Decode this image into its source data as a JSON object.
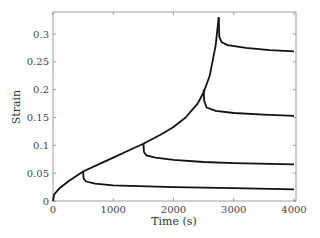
{
  "chart_data": {
    "type": "line",
    "title": "",
    "xlabel": "Time (s)",
    "ylabel": "Strain",
    "xlim": [
      0,
      4000
    ],
    "ylim": [
      0,
      0.34
    ],
    "xticks": [
      "0",
      "1000",
      "2000",
      "3000",
      "4000"
    ],
    "yticks": [
      "0",
      "0.05",
      "0.1",
      "0.15",
      "0.2",
      "0.25",
      "0.3"
    ],
    "grid": false,
    "legend": "none",
    "series": [
      {
        "name": "loading curve",
        "x": [
          0,
          20,
          100,
          250,
          500,
          800,
          1000,
          1300,
          1500,
          1800,
          2000,
          2200,
          2400,
          2500,
          2600,
          2700,
          2750
        ],
        "y": [
          0,
          0.012,
          0.022,
          0.035,
          0.053,
          0.068,
          0.078,
          0.093,
          0.103,
          0.12,
          0.133,
          0.15,
          0.175,
          0.195,
          0.225,
          0.28,
          0.33
        ]
      },
      {
        "name": "unload at 500 s",
        "x": [
          500,
          510,
          550,
          700,
          1000,
          2000,
          3000,
          4000
        ],
        "y": [
          0.053,
          0.04,
          0.035,
          0.031,
          0.028,
          0.025,
          0.023,
          0.021
        ]
      },
      {
        "name": "unload at 1500 s",
        "x": [
          1500,
          1510,
          1550,
          1700,
          2000,
          2500,
          3000,
          4000
        ],
        "y": [
          0.103,
          0.088,
          0.082,
          0.078,
          0.074,
          0.07,
          0.068,
          0.066
        ]
      },
      {
        "name": "unload at 2500 s",
        "x": [
          2500,
          2510,
          2550,
          2700,
          3000,
          3500,
          4000
        ],
        "y": [
          0.2,
          0.18,
          0.168,
          0.162,
          0.158,
          0.155,
          0.153
        ]
      },
      {
        "name": "unload at 2750 s",
        "x": [
          2750,
          2760,
          2800,
          2900,
          3200,
          3600,
          4000
        ],
        "y": [
          0.33,
          0.295,
          0.285,
          0.28,
          0.275,
          0.271,
          0.269
        ]
      }
    ]
  }
}
